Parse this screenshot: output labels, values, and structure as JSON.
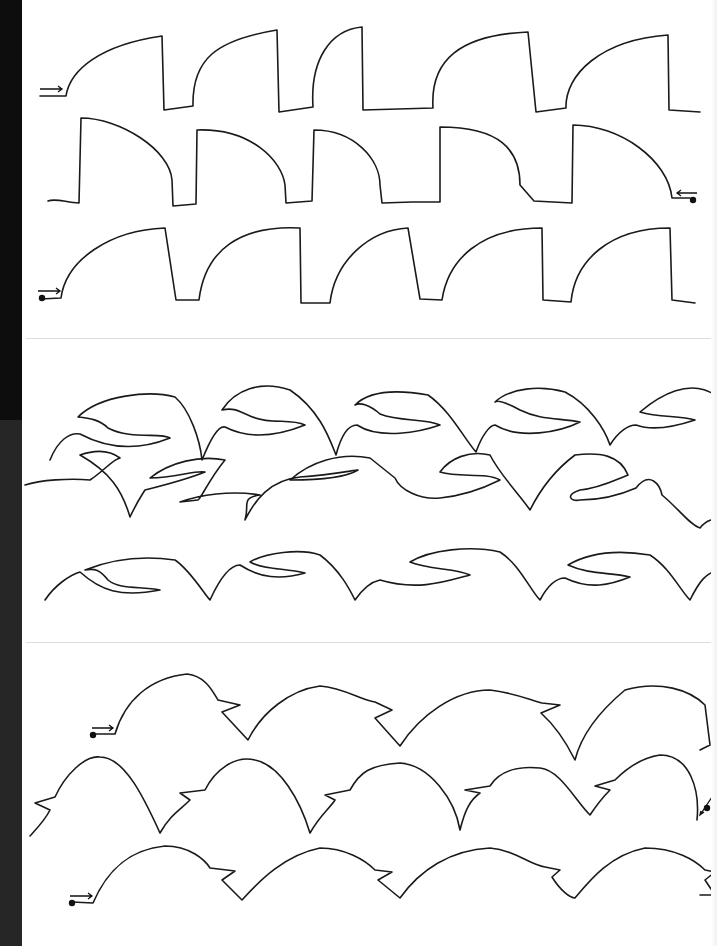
{
  "page": {
    "type": "continuous-line quilting pattern sheet",
    "background": "#ffffff",
    "line_color": "#1a1a1a",
    "edge_strip_color": "#0d0d0d",
    "divider_color": "#dcdcdc"
  },
  "panels": [
    {
      "id": "panel-1",
      "motif": "curved-fin / wave-block",
      "rows": 3,
      "repeats_per_row": 5,
      "start_marker": {
        "row": 1,
        "side": "left",
        "symbol": "double-line arrow →"
      },
      "turn_marker": {
        "row": 2,
        "side": "right",
        "symbol": "dot + arrow ←"
      },
      "end_marker": {
        "row": 3,
        "side": "left",
        "symbol": "dot + arrow →"
      }
    },
    {
      "id": "panel-2",
      "motif": "leaf / wave-swoosh",
      "rows": 3,
      "repeats_per_row": 5
    },
    {
      "id": "panel-3",
      "motif": "bird-head arch",
      "rows": 3,
      "repeats_per_row": 4,
      "start_marker": {
        "row": 1,
        "side": "left",
        "symbol": "dot + arrow →"
      },
      "turn_marker": {
        "row": 2,
        "side": "right",
        "symbol": "dot + arrow ↙"
      },
      "end_marker": {
        "row": 3,
        "side": "left",
        "symbol": "dot + arrow →"
      }
    }
  ],
  "dividers": [
    {
      "y": 338
    },
    {
      "y": 642
    }
  ]
}
